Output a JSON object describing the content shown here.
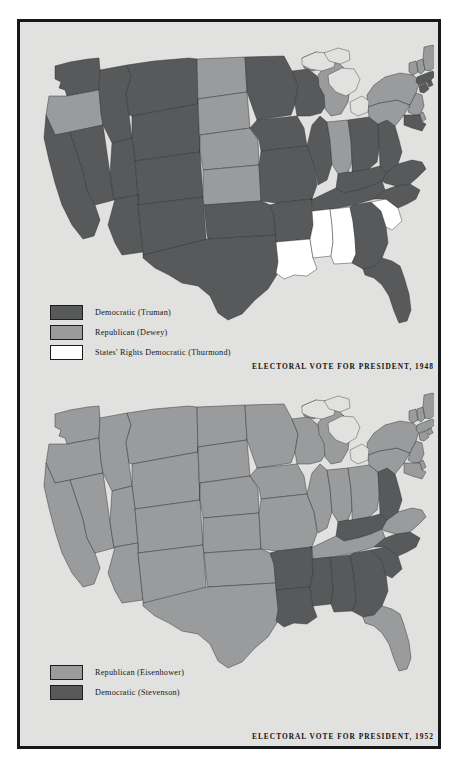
{
  "page": {
    "background_color": "#ffffff",
    "frame_border_color": "#16181a",
    "panel_background_color": "#e1e1df"
  },
  "palette": {
    "democratic": "#58595b",
    "republican": "#9a9b9c",
    "states_rights": "#ffffff",
    "water": "#e1e1df",
    "border": "#2a2c2e"
  },
  "maps": [
    {
      "id": "map-1948",
      "title": "ELECTORAL VOTE FOR PRESIDENT, 1948",
      "legend": [
        {
          "label": "Democratic  (Truman)",
          "color": "#58595b",
          "key": "democratic"
        },
        {
          "label": "Republican  (Dewey)",
          "color": "#9a9b9c",
          "key": "republican"
        },
        {
          "label": "States' Rights Democratic  (Thurmond)",
          "color": "#ffffff",
          "key": "states_rights"
        }
      ],
      "results": {
        "AL": "states_rights",
        "AZ": "democratic",
        "AR": "democratic",
        "CA": "democratic",
        "CO": "democratic",
        "CT": "democratic",
        "DE": "republican",
        "FL": "democratic",
        "GA": "democratic",
        "ID": "democratic",
        "IL": "democratic",
        "IN": "republican",
        "IA": "democratic",
        "KS": "republican",
        "KY": "democratic",
        "LA": "states_rights",
        "ME": "republican",
        "MD": "democratic",
        "MA": "democratic",
        "MI": "republican",
        "MN": "democratic",
        "MS": "states_rights",
        "MO": "democratic",
        "MT": "democratic",
        "NE": "republican",
        "NV": "democratic",
        "NH": "republican",
        "NJ": "republican",
        "NM": "democratic",
        "NY": "republican",
        "NC": "democratic",
        "ND": "republican",
        "OH": "democratic",
        "OK": "democratic",
        "OR": "republican",
        "PA": "republican",
        "RI": "democratic",
        "SC": "states_rights",
        "SD": "republican",
        "TN": "democratic",
        "TX": "democratic",
        "UT": "democratic",
        "VT": "republican",
        "VA": "democratic",
        "WA": "democratic",
        "WV": "democratic",
        "WI": "democratic",
        "WY": "democratic"
      }
    },
    {
      "id": "map-1952",
      "title": "ELECTORAL VOTE FOR PRESIDENT, 1952",
      "legend": [
        {
          "label": "Republican  (Eisenhower)",
          "color": "#9a9b9c",
          "key": "republican"
        },
        {
          "label": "Democratic  (Stevenson)",
          "color": "#58595b",
          "key": "democratic"
        }
      ],
      "results": {
        "AL": "democratic",
        "AZ": "republican",
        "AR": "democratic",
        "CA": "republican",
        "CO": "republican",
        "CT": "republican",
        "DE": "republican",
        "FL": "republican",
        "GA": "democratic",
        "ID": "republican",
        "IL": "republican",
        "IN": "republican",
        "IA": "republican",
        "KS": "republican",
        "KY": "democratic",
        "LA": "democratic",
        "ME": "republican",
        "MD": "republican",
        "MA": "republican",
        "MI": "republican",
        "MN": "republican",
        "MS": "democratic",
        "MO": "republican",
        "MT": "republican",
        "NE": "republican",
        "NV": "republican",
        "NH": "republican",
        "NJ": "republican",
        "NM": "republican",
        "NY": "republican",
        "NC": "democratic",
        "ND": "republican",
        "OH": "republican",
        "OK": "republican",
        "OR": "republican",
        "PA": "republican",
        "RI": "republican",
        "SC": "democratic",
        "SD": "republican",
        "TN": "republican",
        "TX": "republican",
        "UT": "republican",
        "VT": "republican",
        "VA": "republican",
        "WA": "republican",
        "WV": "democratic",
        "WI": "republican",
        "WY": "republican"
      }
    }
  ]
}
